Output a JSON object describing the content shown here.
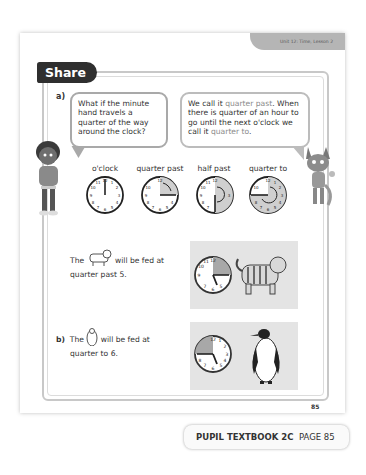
{
  "header": {
    "unit_label": "Unit 12: Time, Lesson 2"
  },
  "section": {
    "title": "Share"
  },
  "part_a": {
    "label": "a)",
    "bubble_left": "What if the minute hand travels a quarter of the way around the clock?",
    "bubble_right": {
      "pre": "We call it ",
      "hl1": "quarter past",
      "mid": ". When there is quarter of an hour to go until the next o'clock we call it ",
      "hl2": "quarter to",
      "post": "."
    },
    "clocks": [
      {
        "label": "o'clock"
      },
      {
        "label": "quarter past"
      },
      {
        "label": "half past"
      },
      {
        "label": "quarter to"
      }
    ],
    "tiger_text": {
      "pre": "The",
      "post": "will be fed at",
      "line2": "quarter past 5."
    }
  },
  "part_b": {
    "label": "b)",
    "penguin_text": {
      "pre": "The",
      "post": "will be fed at",
      "line2": "quarter to 6."
    }
  },
  "footer": {
    "page_number": "85",
    "book": "PUPIL TEXTBOOK 2C",
    "page": "PAGE 85"
  },
  "colors": {
    "share_tab": "#2f2f2f",
    "unit_tab": "#b5b5b5",
    "shade": "#bdbdbd",
    "picbox": "#e4e4e4"
  }
}
